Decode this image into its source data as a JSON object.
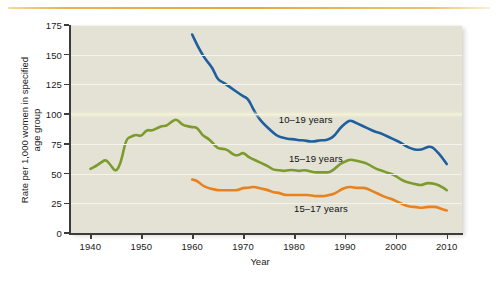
{
  "figure": {
    "top_rule_color": "#e3a93c",
    "plot_background": "#e3e2d5"
  },
  "chart_data": {
    "type": "line",
    "title": "",
    "xlabel": "Year",
    "ylabel": "Rate per 1,000 women in specified age group",
    "xlim": [
      1936,
      2013
    ],
    "ylim": [
      0,
      175
    ],
    "xticks": [
      1940,
      1950,
      1960,
      1970,
      1980,
      1990,
      2000,
      2010
    ],
    "xtick_labels": [
      "1940",
      "1950",
      "1960",
      "1970",
      "1980",
      "1990",
      "2000",
      "2010"
    ],
    "yticks": [
      0,
      25,
      50,
      75,
      100,
      125,
      150,
      175
    ],
    "ytick_labels": [
      "0",
      "25",
      "50",
      "75",
      "100",
      "125",
      "150",
      "175"
    ],
    "grid": "horizontal",
    "legend_position": "inline-annotations",
    "series": [
      {
        "name": "10–19 years",
        "color": "#1f5f9e",
        "label_x": 1977,
        "label_y": 95,
        "x": [
          1960,
          1961,
          1962,
          1963,
          1964,
          1965,
          1966,
          1967,
          1968,
          1969,
          1970,
          1971,
          1972,
          1973,
          1974,
          1975,
          1976,
          1977,
          1978,
          1979,
          1980,
          1981,
          1982,
          1983,
          1984,
          1985,
          1986,
          1987,
          1988,
          1989,
          1990,
          1991,
          1992,
          1993,
          1994,
          1995,
          1996,
          1997,
          1998,
          1999,
          2000,
          2001,
          2002,
          2003,
          2004,
          2005,
          2006,
          2007,
          2008,
          2009,
          2010
        ],
        "y": [
          167,
          158,
          150,
          144,
          139,
          129,
          127,
          124,
          121,
          118,
          115,
          113,
          104,
          97,
          92,
          88,
          84,
          81,
          80,
          79,
          79,
          78,
          78,
          77,
          77,
          78,
          78,
          79,
          82,
          88,
          92,
          95,
          93,
          91,
          89,
          87,
          85,
          84,
          82,
          80,
          78,
          76,
          73,
          71,
          70,
          70,
          72,
          73,
          69,
          64,
          58
        ]
      },
      {
        "name": "15–19 years",
        "color": "#7d9b2d",
        "label_x": 1979,
        "label_y": 62,
        "x": [
          1940,
          1941,
          1942,
          1943,
          1944,
          1945,
          1946,
          1947,
          1948,
          1949,
          1950,
          1951,
          1952,
          1953,
          1954,
          1955,
          1956,
          1957,
          1958,
          1959,
          1960,
          1961,
          1962,
          1963,
          1964,
          1965,
          1966,
          1967,
          1968,
          1969,
          1970,
          1971,
          1972,
          1973,
          1974,
          1975,
          1976,
          1977,
          1978,
          1979,
          1980,
          1981,
          1982,
          1983,
          1984,
          1985,
          1986,
          1987,
          1988,
          1989,
          1990,
          1991,
          1992,
          1993,
          1994,
          1995,
          1996,
          1997,
          1998,
          1999,
          2000,
          2001,
          2002,
          2003,
          2004,
          2005,
          2006,
          2007,
          2008,
          2009,
          2010
        ],
        "y": [
          54,
          56,
          59,
          62,
          57,
          51,
          59,
          79,
          81,
          83,
          81,
          87,
          86,
          88,
          90,
          90,
          94,
          96,
          91,
          90,
          89,
          89,
          82,
          80,
          76,
          71,
          71,
          70,
          66,
          65,
          68,
          64,
          62,
          60,
          58,
          56,
          53,
          53,
          52,
          53,
          53,
          52,
          53,
          52,
          51,
          51,
          51,
          51,
          54,
          58,
          60,
          62,
          61,
          60,
          59,
          57,
          54,
          53,
          51,
          50,
          48,
          45,
          43,
          42,
          41,
          40,
          42,
          42,
          41,
          39,
          36
        ]
      },
      {
        "name": "15–17 years",
        "color": "#e8821e",
        "label_x": 1980,
        "label_y": 20,
        "x": [
          1960,
          1961,
          1962,
          1963,
          1964,
          1965,
          1966,
          1967,
          1968,
          1969,
          1970,
          1971,
          1972,
          1973,
          1974,
          1975,
          1976,
          1977,
          1978,
          1979,
          1980,
          1981,
          1982,
          1983,
          1984,
          1985,
          1986,
          1987,
          1988,
          1989,
          1990,
          1991,
          1992,
          1993,
          1994,
          1995,
          1996,
          1997,
          1998,
          1999,
          2000,
          2001,
          2002,
          2003,
          2004,
          2005,
          2006,
          2007,
          2008,
          2009,
          2010
        ],
        "y": [
          45,
          44,
          40,
          38,
          37,
          36,
          36,
          36,
          36,
          36,
          38,
          38,
          39,
          38,
          37,
          36,
          34,
          34,
          32,
          32,
          32,
          32,
          32,
          32,
          31,
          31,
          31,
          32,
          33,
          36,
          38,
          39,
          38,
          38,
          38,
          36,
          34,
          32,
          30,
          29,
          27,
          25,
          23,
          22,
          22,
          21,
          22,
          22,
          22,
          20,
          19
        ]
      }
    ]
  }
}
